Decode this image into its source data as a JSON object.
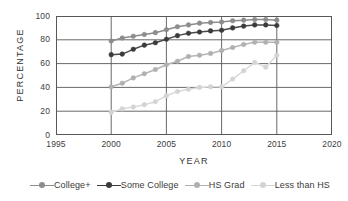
{
  "chart_data": {
    "type": "line",
    "title": "",
    "xlabel": "YEAR",
    "ylabel": "PERCENTAGE",
    "xlim": [
      1995,
      2020
    ],
    "ylim": [
      0,
      100
    ],
    "xticks": [
      "1995",
      "2000",
      "2005",
      "2010",
      "2015",
      "2020"
    ],
    "yticks": [
      "0",
      "20",
      "40",
      "60",
      "80",
      "100"
    ],
    "grid": "both",
    "legend_position": "below",
    "x": [
      2000,
      2001,
      2002,
      2003,
      2004,
      2005,
      2006,
      2007,
      2008,
      2009,
      2010,
      2011,
      2012,
      2013,
      2014,
      2015
    ],
    "series": [
      {
        "name": "College+",
        "color": "#8c8c8e",
        "marker_color": "#8c8c8e",
        "values": [
          79,
          81.5,
          83,
          84.5,
          86,
          88.5,
          91,
          92.5,
          94,
          94.5,
          95,
          96,
          96.5,
          97,
          97,
          96.5
        ]
      },
      {
        "name": "Some College",
        "color": "#4a4a4c",
        "marker_color": "#3b3b3d",
        "values": [
          67.5,
          68,
          72,
          75.5,
          77.5,
          80.5,
          83.5,
          85.5,
          86.5,
          87.5,
          88,
          90,
          91.5,
          92.5,
          92.5,
          92
        ]
      },
      {
        "name": "HS Grad",
        "color": "#b6b6b8",
        "marker_color": "#b0b0b2",
        "values": [
          40.5,
          43.5,
          48,
          51.5,
          55,
          59,
          62,
          66,
          67,
          68.5,
          71,
          73.5,
          76,
          78,
          78,
          78
        ]
      },
      {
        "name": "Less than HS",
        "color": "#dadadc",
        "marker_color": "#d4d4d6",
        "values": [
          19,
          22,
          23.5,
          25.5,
          28,
          33,
          36.5,
          38.5,
          40,
          40.5,
          40.5,
          47,
          54,
          61,
          57,
          67
        ]
      }
    ]
  },
  "axes": {
    "y_title": "PERCENTAGE",
    "x_title": "YEAR",
    "yticks": [
      {
        "label": "100",
        "value": 100
      },
      {
        "label": "80",
        "value": 80
      },
      {
        "label": "60",
        "value": 60
      },
      {
        "label": "40",
        "value": 40
      },
      {
        "label": "20",
        "value": 20
      },
      {
        "label": "0",
        "value": 0
      }
    ],
    "xticks": [
      {
        "label": "1995",
        "value": 1995
      },
      {
        "label": "2000",
        "value": 2000
      },
      {
        "label": "2005",
        "value": 2005
      },
      {
        "label": "2010",
        "value": 2010
      },
      {
        "label": "2015",
        "value": 2015
      },
      {
        "label": "2020",
        "value": 2020
      }
    ]
  },
  "legend": {
    "items": [
      {
        "label": "College+",
        "color": "#8c8c8e"
      },
      {
        "label": "Some College",
        "color": "#3b3b3d"
      },
      {
        "label": "HS Grad",
        "color": "#b0b0b2"
      },
      {
        "label": "Less than HS",
        "color": "#d4d4d6"
      }
    ]
  }
}
